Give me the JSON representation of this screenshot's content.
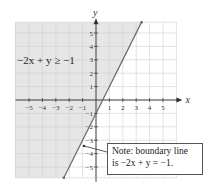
{
  "chart_data": {
    "type": "line",
    "title": "",
    "xlabel": "x",
    "ylabel": "y",
    "xlim": [
      -6,
      6
    ],
    "ylim": [
      -5.8,
      5.8
    ],
    "grid": true,
    "x_ticks": [
      -5,
      -4,
      -3,
      -2,
      -1,
      1,
      2,
      3,
      4,
      5
    ],
    "y_ticks": [
      5,
      4,
      3,
      2,
      1,
      -1,
      -2,
      -3,
      -4,
      -5
    ],
    "series": [
      {
        "name": "boundary line -2x + y = -1 (y = 2x - 1)",
        "x": [
          -2.4,
          3.4
        ],
        "y": [
          -5.8,
          5.8
        ]
      }
    ],
    "shaded_region": "above/left of line (-2x + y >= -1)",
    "annotations": [
      {
        "text": "-2x + y ≥ -1",
        "position": "upper left, shaded region"
      },
      {
        "text": "Note: boundary line is -2x + y = -1.",
        "position": "lower right box with arrow pointing to line"
      }
    ]
  },
  "labels": {
    "inequality": "−2x + y ≥ −1",
    "x_axis": "x",
    "y_axis": "y",
    "note_line1": "Note: boundary line",
    "note_line2": "is −2x + y = −1."
  },
  "colors": {
    "shade": "#e6e6e6",
    "grid": "#cfcfcf",
    "line": "#666666",
    "axis": "#333333"
  }
}
